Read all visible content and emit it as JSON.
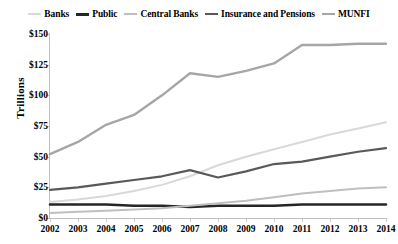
{
  "chart_data": {
    "type": "line",
    "title": "",
    "xlabel": "",
    "ylabel": "Trillions",
    "x": [
      2002,
      2003,
      2004,
      2005,
      2006,
      2007,
      2008,
      2009,
      2010,
      2011,
      2012,
      2013,
      2014
    ],
    "xtick_labels": [
      "2002",
      "2003",
      "2004",
      "2005",
      "2006",
      "2007",
      "2008",
      "2009",
      "2010",
      "2011",
      "2012",
      "2013",
      "2014"
    ],
    "ytick_labels": [
      "$0",
      "$25",
      "$50",
      "$75",
      "$100",
      "$125",
      "$150"
    ],
    "ytick_values": [
      0,
      25,
      50,
      75,
      100,
      125,
      150
    ],
    "ylim": [
      0,
      150
    ],
    "xlim": [
      2002,
      2014
    ],
    "grid": false,
    "legend_position": "top",
    "series": [
      {
        "name": "Banks",
        "color": "#d9d9d9",
        "width": 2.0,
        "values": [
          13,
          15,
          18,
          22,
          27,
          34,
          43,
          50,
          56,
          62,
          68,
          73,
          78
        ]
      },
      {
        "name": "Public",
        "color": "#262626",
        "width": 2.6,
        "values": [
          11,
          11,
          11,
          10,
          10,
          9,
          10,
          10,
          10,
          11,
          11,
          11,
          11
        ]
      },
      {
        "name": "Central Banks",
        "color": "#bfbfbf",
        "width": 2.0,
        "values": [
          4,
          5,
          6,
          7,
          8,
          10,
          12,
          14,
          17,
          20,
          22,
          24,
          25
        ]
      },
      {
        "name": "Insurance and Pensions",
        "color": "#595959",
        "width": 2.2,
        "values": [
          23,
          25,
          28,
          31,
          34,
          39,
          33,
          38,
          44,
          46,
          50,
          54,
          57
        ]
      },
      {
        "name": "MUNFI",
        "color": "#a6a6a6",
        "width": 2.4,
        "values": [
          52,
          62,
          76,
          84,
          100,
          118,
          115,
          120,
          126,
          141,
          141,
          142,
          142
        ]
      }
    ]
  }
}
